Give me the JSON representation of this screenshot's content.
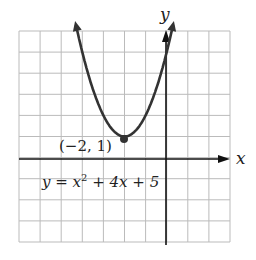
{
  "chart_data": {
    "type": "line",
    "title": "",
    "equation": "y = x^2 + 4x + 5",
    "equation_parts": {
      "lhs": "y = x",
      "exp": "2",
      "rhs": " + 4x + 5"
    },
    "xlabel": "x",
    "ylabel": "y",
    "xlim": [
      -7,
      3
    ],
    "ylim": [
      -4,
      6
    ],
    "grid": true,
    "vertex": {
      "x": -2,
      "y": 1,
      "label": "(−2, 1)"
    },
    "series": [
      {
        "name": "y = x^2 + 4x + 5",
        "x": [
          -4.4,
          -4,
          -3,
          -2,
          -1,
          0,
          0.4
        ],
        "y": [
          6.76,
          5,
          2,
          1,
          2,
          5,
          6.76
        ]
      }
    ]
  },
  "colors": {
    "curve": "#333333",
    "grid": "#bbbbbb",
    "axis": "#111111"
  }
}
